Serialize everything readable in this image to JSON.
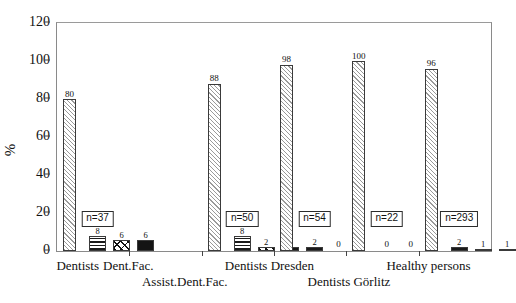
{
  "chart_data": {
    "type": "bar",
    "title": "",
    "xlabel": "",
    "ylabel": "%",
    "ylim": [
      0,
      120
    ],
    "yticks": [
      0,
      20,
      40,
      60,
      80,
      100,
      120
    ],
    "grid": false,
    "legend": "none",
    "categories": [
      "Dentists",
      "Dent.Fac.",
      "Assist.Dent.Fac.",
      "Dentists Dresden",
      "Dentists Görlitz",
      "Healthy persons"
    ],
    "groups": [
      {
        "label": "Dentists",
        "n_label": "n=37",
        "bars": [
          {
            "value": 80,
            "value_label": "80",
            "pattern": "hatch-light"
          },
          {
            "value": 8,
            "value_label": "8",
            "pattern": "hstripe"
          },
          {
            "value": 6,
            "value_label": "6",
            "pattern": "diag"
          },
          {
            "value": 6,
            "value_label": "6",
            "pattern": "solid"
          }
        ]
      },
      {
        "label": "Dent.Fac.",
        "n_label": "",
        "bars": []
      },
      {
        "label": "Assist.Dent.Fac.",
        "n_label": "n=50",
        "bars": [
          {
            "value": 88,
            "value_label": "88",
            "pattern": "hatch-light"
          },
          {
            "value": 8,
            "value_label": "8",
            "pattern": "hstripe"
          },
          {
            "value": 2,
            "value_label": "2",
            "pattern": "diag"
          },
          {
            "value": 2,
            "value_label": "2",
            "pattern": "solid"
          }
        ]
      },
      {
        "label": "Dentists Dresden",
        "n_label": "n=54",
        "bars": [
          {
            "value": 98,
            "value_label": "98",
            "pattern": "hatch-light"
          },
          {
            "value": 2,
            "value_label": "2",
            "pattern": "hstripe"
          },
          {
            "value": 0,
            "value_label": "0",
            "pattern": "diag"
          },
          {
            "value": 0,
            "value_label": "0",
            "pattern": "solid"
          }
        ]
      },
      {
        "label": "Dentists Görlitz",
        "n_label": "n=22",
        "bars": [
          {
            "value": 100,
            "value_label": "100",
            "pattern": "hatch-light"
          },
          {
            "value": 0,
            "value_label": "0",
            "pattern": "hstripe"
          },
          {
            "value": 0,
            "value_label": "0",
            "pattern": "diag"
          },
          {
            "value": 0,
            "value_label": "0",
            "pattern": "solid"
          }
        ]
      },
      {
        "label": "Healthy persons",
        "n_label": "n=293",
        "bars": [
          {
            "value": 96,
            "value_label": "96",
            "pattern": "hatch-light"
          },
          {
            "value": 2,
            "value_label": "2",
            "pattern": "hstripe"
          },
          {
            "value": 1,
            "value_label": "1",
            "pattern": "diag"
          },
          {
            "value": 1,
            "value_label": "1",
            "pattern": "solid"
          }
        ]
      }
    ],
    "colors": {
      "axis": "#8a8a8a",
      "bar_outline": "#3a3a3a",
      "hatch_light": "#9a9a9a",
      "solid": "#141414",
      "text": "#111111"
    }
  }
}
